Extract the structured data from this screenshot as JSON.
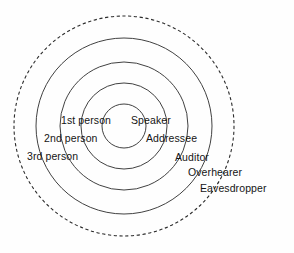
{
  "figure": {
    "background_color": "#fefefe",
    "stroke_color": "#2b2b2b"
  },
  "chart_data": {
    "type": "diagram",
    "subtype": "concentric-circles",
    "title": "",
    "center": {
      "x": 124,
      "y": 126
    },
    "rings": [
      {
        "index": 1,
        "radius": 22,
        "style": "solid",
        "inner_label": "",
        "outer_label": "Speaker"
      },
      {
        "index": 2,
        "radius": 43,
        "style": "solid",
        "inner_label": "1st person",
        "outer_label": "Addressee"
      },
      {
        "index": 3,
        "radius": 64,
        "style": "solid",
        "inner_label": "2nd person",
        "outer_label": "Auditor"
      },
      {
        "index": 4,
        "radius": 88,
        "style": "solid",
        "inner_label": "3rd person",
        "outer_label": "Overhearer"
      },
      {
        "index": 5,
        "radius": 110,
        "style": "dashed",
        "inner_label": "",
        "outer_label": "Eavesdropper"
      }
    ]
  },
  "labels": {
    "left": {
      "first_person": "1st person",
      "second_person": "2nd person",
      "third_person": "3rd person"
    },
    "right": {
      "speaker": "Speaker",
      "addressee": "Addressee",
      "auditor": "Auditor",
      "overhearer": "Overhearer",
      "eavesdropper": "Eavesdropper"
    }
  }
}
